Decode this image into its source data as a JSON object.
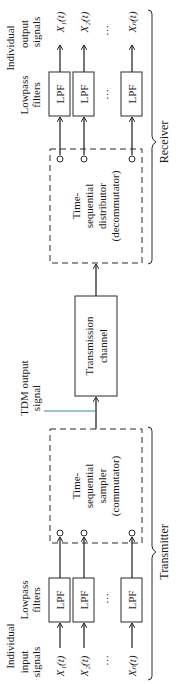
{
  "diagram": {
    "receiver": {
      "label": "Receiver",
      "output_header": [
        "Individual",
        "output",
        "signals"
      ],
      "filters_header": [
        "Lowpass",
        "filters"
      ],
      "lpf_label": "LPF",
      "outputs": [
        "X₁(t)",
        "X₂(t)",
        "Xₙ(t)"
      ],
      "block": [
        "Time-",
        "sequential",
        "distributor",
        "(decommutator)"
      ],
      "ellipsis": "⋯"
    },
    "channel": {
      "label": [
        "Transmission",
        "channel"
      ]
    },
    "tdm": {
      "label": [
        "TDM output",
        "signal"
      ]
    },
    "transmitter": {
      "label": "Transmitter",
      "input_header": [
        "Individual",
        "input",
        "signals"
      ],
      "filters_header": [
        "Lowpass",
        "filters"
      ],
      "lpf_label": "LPF",
      "inputs": [
        "X₁(t)",
        "X₂(t)",
        "Xₙ(t)"
      ],
      "block": [
        "Time-",
        "sequential",
        "sampler",
        "(commutator)"
      ],
      "ellipsis": "⋯"
    },
    "colors": {
      "line": "#2a2a2a",
      "tdm_line": "#2a8a9a"
    }
  }
}
